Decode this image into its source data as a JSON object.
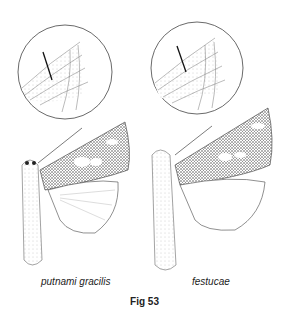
{
  "figure": {
    "caption": "Fig 53",
    "specimens": [
      {
        "name": "putnami gracilis",
        "detail_inset": "forewing-venation-circle"
      },
      {
        "name": "festucae",
        "detail_inset": "forewing-venation-circle"
      }
    ]
  },
  "colors": {
    "ink": "#222222",
    "background": "#ffffff"
  }
}
